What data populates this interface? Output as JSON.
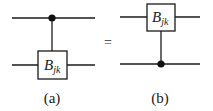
{
  "diagram": {
    "type": "quantum-circuit-equivalence",
    "equals_sign": "=",
    "panels": [
      {
        "caption": "(a)",
        "gate": {
          "base": "B",
          "subscript": "jk",
          "on_wire": "bottom"
        },
        "control": {
          "on_wire": "top"
        }
      },
      {
        "caption": "(b)",
        "gate": {
          "base": "B",
          "subscript": "jk",
          "on_wire": "top"
        },
        "control": {
          "on_wire": "bottom"
        }
      }
    ]
  }
}
